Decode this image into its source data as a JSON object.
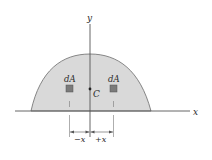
{
  "diagram": {
    "axes": {
      "x_label": "x",
      "y_label": "y"
    },
    "region": {
      "fill": "#d9d9d9",
      "stroke": "#6b6b6b"
    },
    "centroid": {
      "label": "C"
    },
    "elements": [
      {
        "label": "dA",
        "side": "left"
      },
      {
        "label": "dA",
        "side": "right"
      }
    ],
    "dimensions": {
      "left_label": "−x",
      "right_label": "+x"
    },
    "colors": {
      "element_fill": "#7a7a7a",
      "axis": "#555555"
    }
  }
}
